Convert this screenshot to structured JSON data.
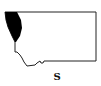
{
  "map": {
    "region": "Montana",
    "highlighted_area": "northwest",
    "outline_color": "#222222",
    "fill_color": "#000000",
    "background": "#ffffff"
  },
  "label": "S"
}
